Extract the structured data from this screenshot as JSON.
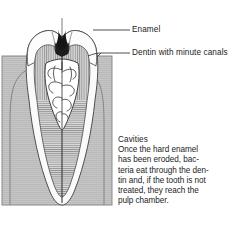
{
  "figure": {
    "labels": [
      {
        "id": "enamel",
        "text": "Enamel"
      },
      {
        "id": "dentin",
        "text": "Dentin with minute canals"
      }
    ],
    "caption": {
      "title": "Cavities",
      "lines": [
        "Once the hard enamel",
        "has been eroded, bac-",
        "teria eat through the den-",
        "tin and, if the tooth is not",
        "treated, they reach the",
        "pulp chamber."
      ]
    },
    "colors": {
      "gum": "#c6c6c6",
      "gum_border": "#6f6f6f",
      "enamel": "#fbfbfb",
      "enamel_outline": "#555555",
      "dentin": "#d8d8d8",
      "dentin_hatch": "#6b6b6b",
      "pulp": "#ffffff",
      "pulp_vessel": "#3a3a3a",
      "cavity": "#1a1a1a",
      "leader_line": "#3d3d3d",
      "text": "#1d1d1d",
      "background": "#ffffff"
    }
  }
}
